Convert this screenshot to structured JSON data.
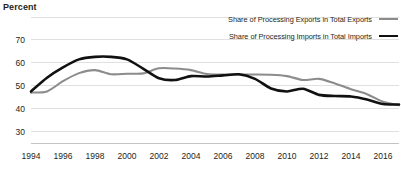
{
  "chart_data": {
    "type": "line",
    "title": "",
    "subtitle": "",
    "ylabel": "Percent",
    "xlabel": "",
    "ylim": [
      25,
      80
    ],
    "xlim": [
      1994,
      2017
    ],
    "grid": true,
    "legend_position": "top-right",
    "ytick_labels": [
      "30",
      "40",
      "50",
      "60",
      "70"
    ],
    "yticks": [
      30,
      40,
      50,
      60,
      70
    ],
    "gridline_values": [
      30,
      40,
      50,
      60,
      70,
      80
    ],
    "xtick_labels": [
      "1994",
      "1996",
      "1998",
      "2000",
      "2002",
      "2004",
      "2006",
      "2008",
      "2010",
      "2012",
      "2014",
      "2016"
    ],
    "xticks": [
      1994,
      1996,
      1998,
      2000,
      2002,
      2004,
      2006,
      2008,
      2010,
      2012,
      2014,
      2016
    ],
    "x": [
      1994,
      1995,
      1996,
      1997,
      1998,
      1999,
      2000,
      2001,
      2002,
      2003,
      2004,
      2005,
      2006,
      2007,
      2008,
      2009,
      2010,
      2011,
      2012,
      2013,
      2014,
      2015,
      2016,
      2017
    ],
    "series": [
      {
        "name": "Share of Processing Exports in Total Exports",
        "color": "#8c8c8c",
        "width": 2.1,
        "values": [
          47.0,
          47.5,
          52.0,
          55.5,
          56.8,
          55.0,
          55.2,
          55.4,
          57.6,
          57.5,
          56.8,
          55.1,
          54.9,
          54.9,
          54.9,
          54.8,
          54.2,
          52.5,
          53.0,
          51.0,
          48.5,
          46.3,
          43.0,
          41.5
        ]
      },
      {
        "name": "Share of Processing Imports in Total Imports",
        "color": "#111111",
        "width": 2.6,
        "values": [
          47.5,
          53.5,
          58.0,
          61.5,
          62.6,
          62.6,
          61.5,
          57.5,
          53.3,
          52.5,
          54.2,
          54.0,
          54.5,
          55.0,
          53.0,
          48.8,
          47.5,
          48.7,
          46.0,
          45.5,
          45.3,
          44.0,
          42.0,
          41.8
        ]
      }
    ]
  }
}
